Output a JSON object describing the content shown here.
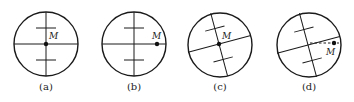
{
  "figure": {
    "panels": [
      {
        "id": "a",
        "caption": "(a)",
        "point_label": "M",
        "rotation_deg": 0,
        "point": "center"
      },
      {
        "id": "b",
        "caption": "(b)",
        "point_label": "M",
        "rotation_deg": 0,
        "point": "right-edge-on-horizontal"
      },
      {
        "id": "c",
        "caption": "(c)",
        "point_label": "M",
        "rotation_deg": -15,
        "point": "center"
      },
      {
        "id": "d",
        "caption": "(d)",
        "point_label": "M",
        "rotation_deg": -15,
        "point": "right-edge-horizontal-dashed"
      }
    ],
    "colors": {
      "stroke": "#1a1a1a",
      "background": "#ffffff"
    }
  }
}
